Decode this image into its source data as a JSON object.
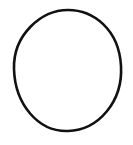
{
  "canvas": {
    "width": 133,
    "height": 145,
    "background_color": "#ffffff",
    "description": "Hand-drawn black circle outline on a plain white background"
  },
  "figure": {
    "name": "circle-outline",
    "shape_type": "circle",
    "stroke_color": "#111111",
    "fill_color": "none",
    "stroke_width": 2.6,
    "center_x": 68,
    "center_y": 70.5,
    "radius_x": 54,
    "radius_y": 60.5,
    "bounds": {
      "left": 14,
      "top": 10,
      "right": 122,
      "bottom": 131
    },
    "path": "M 68 10 C 93 10 119 29 121 66 C 123 101 99 130 68 131 C 38 132 15 104 14 69 C 13 35 41 10 68 10 Z"
  }
}
